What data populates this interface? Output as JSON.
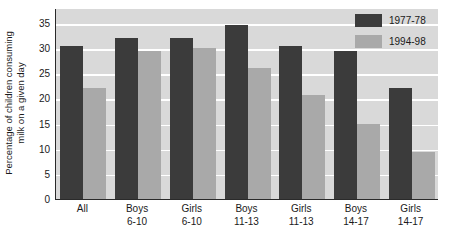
{
  "chart_data": {
    "type": "bar",
    "title": "",
    "xlabel": "",
    "ylabel": "Percentage of children consuming milk on a given day",
    "ylim": [
      0,
      38
    ],
    "ytick_values": [
      0,
      5,
      10,
      15,
      20,
      25,
      30,
      35
    ],
    "ytick_labels": [
      "0",
      "5",
      "10",
      "15",
      "20",
      "25",
      "30",
      "35"
    ],
    "grid": true,
    "grid_axis": "y",
    "legend_position": "top-right",
    "categories": [
      "All",
      "Boys 6-10",
      "Girls 6-10",
      "Boys 11-13",
      "Girls 11-13",
      "Boys 14-17",
      "Girls 14-17"
    ],
    "category_lines": [
      [
        "All",
        ""
      ],
      [
        "Boys",
        "6-10"
      ],
      [
        "Girls",
        "6-10"
      ],
      [
        "Boys",
        "11-13"
      ],
      [
        "Girls",
        "11-13"
      ],
      [
        "Boys",
        "14-17"
      ],
      [
        "Girls",
        "14-17"
      ]
    ],
    "series": [
      {
        "name": "1977-78",
        "color": "#3b3b3b",
        "values": [
          30.5,
          32.0,
          32.0,
          34.7,
          30.5,
          29.5,
          22.0
        ]
      },
      {
        "name": "1994-98",
        "color": "#a9a9a9",
        "values": [
          22.0,
          29.5,
          30.0,
          26.0,
          20.7,
          15.0,
          9.3
        ]
      }
    ]
  },
  "axes": {
    "y_title_line1": "Percentage of children consuming",
    "y_title_line2": "milk on a given day"
  },
  "legend": {
    "items": [
      {
        "label": "1977-78",
        "color": "#3b3b3b"
      },
      {
        "label": "1994-98",
        "color": "#a9a9a9"
      }
    ]
  },
  "colors": {
    "plot_background": "#d9d9d9",
    "gridline": "#ffffff",
    "axis": "#2a2a2a",
    "series_a": "#3b3b3b",
    "series_b": "#a9a9a9",
    "page_background": "#ffffff"
  }
}
